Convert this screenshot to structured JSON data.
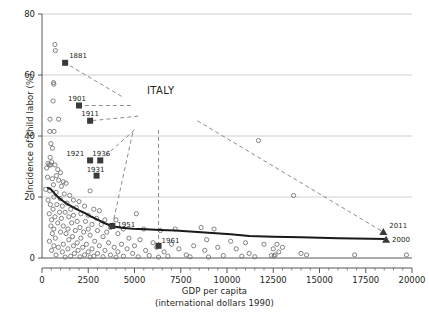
{
  "chart_data": {
    "type": "scatter",
    "title": "",
    "xlabel": "GDP per capita",
    "xlabel2": "(international dollars 1990)",
    "ylabel": "Incidence of child labor (%)",
    "xlim": [
      0,
      20000
    ],
    "ylim": [
      0,
      80
    ],
    "xticks": [
      0,
      2500,
      5000,
      7500,
      10000,
      12500,
      15000,
      17500,
      20000
    ],
    "yticks": [
      0,
      20,
      40,
      60,
      80
    ],
    "xtick_labels": [
      "0",
      "2500",
      "5000",
      "7500",
      "10000",
      "12500",
      "15000",
      "17500",
      "20000"
    ],
    "ytick_labels": [
      "0",
      "20",
      "40",
      "60",
      "80"
    ],
    "grid": "horizontal",
    "legend": "none",
    "annotation": "ITALY",
    "series": [
      {
        "name": "Other countries (scatter)",
        "marker": "open-circle",
        "color": "#6d6e71",
        "points": [
          [
            700,
            70
          ],
          [
            720,
            68
          ],
          [
            620,
            57.5
          ],
          [
            640,
            57.0
          ],
          [
            600,
            51.5
          ],
          [
            430,
            45.5
          ],
          [
            900,
            45.5
          ],
          [
            420,
            41.5
          ],
          [
            650,
            41.5
          ],
          [
            480,
            37.5
          ],
          [
            560,
            36.0
          ],
          [
            440,
            33.0
          ],
          [
            520,
            31.5
          ],
          [
            330,
            31.0
          ],
          [
            390,
            30.5
          ],
          [
            470,
            30.5
          ],
          [
            250,
            29.5
          ],
          [
            700,
            30.5
          ],
          [
            850,
            29.0
          ],
          [
            1000,
            28.0
          ],
          [
            780,
            27.0
          ],
          [
            300,
            26.5
          ],
          [
            560,
            26.0
          ],
          [
            900,
            25.5
          ],
          [
            1150,
            25.0
          ],
          [
            1300,
            24.5
          ],
          [
            620,
            24.0
          ],
          [
            1050,
            23.5
          ],
          [
            2600,
            22.0
          ],
          [
            200,
            22.5
          ],
          [
            420,
            22.0
          ],
          [
            760,
            21.5
          ],
          [
            1200,
            21.0
          ],
          [
            1500,
            20.5
          ],
          [
            640,
            20.0
          ],
          [
            980,
            19.5
          ],
          [
            330,
            19.0
          ],
          [
            1700,
            19.0
          ],
          [
            2000,
            18.5
          ],
          [
            1350,
            18.0
          ],
          [
            800,
            17.5
          ],
          [
            450,
            17.5
          ],
          [
            1100,
            17.0
          ],
          [
            2300,
            17.0
          ],
          [
            1850,
            16.5
          ],
          [
            600,
            16.0
          ],
          [
            1550,
            16.0
          ],
          [
            2800,
            16.0
          ],
          [
            3100,
            15.5
          ],
          [
            950,
            15.0
          ],
          [
            1250,
            15.0
          ],
          [
            2100,
            14.5
          ],
          [
            390,
            14.5
          ],
          [
            1700,
            14.0
          ],
          [
            2500,
            14.0
          ],
          [
            5100,
            14.5
          ],
          [
            700,
            13.5
          ],
          [
            1450,
            13.5
          ],
          [
            2950,
            13.0
          ],
          [
            1050,
            13.0
          ],
          [
            3400,
            12.5
          ],
          [
            520,
            12.5
          ],
          [
            1900,
            12.0
          ],
          [
            2350,
            12.0
          ],
          [
            4000,
            12.5
          ],
          [
            1600,
            11.5
          ],
          [
            850,
            11.5
          ],
          [
            2700,
            11.0
          ],
          [
            3200,
            11.0
          ],
          [
            1150,
            10.5
          ],
          [
            480,
            10.5
          ],
          [
            2050,
            10.0
          ],
          [
            3700,
            10.0
          ],
          [
            1400,
            9.5
          ],
          [
            2500,
            9.5
          ],
          [
            640,
            9.5
          ],
          [
            4400,
            9.5
          ],
          [
            1800,
            9.0
          ],
          [
            3000,
            9.0
          ],
          [
            5500,
            9.5
          ],
          [
            1000,
            8.5
          ],
          [
            2250,
            8.5
          ],
          [
            3500,
            8.5
          ],
          [
            6400,
            9.0
          ],
          [
            7200,
            9.5
          ],
          [
            560,
            8.0
          ],
          [
            1300,
            8.0
          ],
          [
            2600,
            7.5
          ],
          [
            4100,
            8.0
          ],
          [
            8600,
            10.0
          ],
          [
            9300,
            9.5
          ],
          [
            1650,
            7.0
          ],
          [
            3300,
            7.0
          ],
          [
            720,
            6.5
          ],
          [
            2100,
            6.5
          ],
          [
            4700,
            6.5
          ],
          [
            8900,
            6.0
          ],
          [
            1450,
            6.0
          ],
          [
            2850,
            5.5
          ],
          [
            5300,
            6.0
          ],
          [
            10200,
            5.5
          ],
          [
            400,
            5.5
          ],
          [
            1900,
            5.0
          ],
          [
            3600,
            5.0
          ],
          [
            6000,
            5.0
          ],
          [
            11000,
            5.0
          ],
          [
            1150,
            4.5
          ],
          [
            2400,
            4.5
          ],
          [
            4300,
            4.5
          ],
          [
            7000,
            4.5
          ],
          [
            12000,
            4.5
          ],
          [
            640,
            4.0
          ],
          [
            1700,
            4.0
          ],
          [
            3100,
            4.0
          ],
          [
            5000,
            4.0
          ],
          [
            8200,
            4.0
          ],
          [
            12700,
            4.5
          ],
          [
            880,
            3.5
          ],
          [
            2200,
            3.5
          ],
          [
            3900,
            3.5
          ],
          [
            6200,
            3.5
          ],
          [
            9500,
            3.5
          ],
          [
            13000,
            3.5
          ],
          [
            1400,
            3.0
          ],
          [
            2700,
            3.0
          ],
          [
            4600,
            3.0
          ],
          [
            7400,
            3.0
          ],
          [
            10500,
            3.0
          ],
          [
            12500,
            3.0
          ],
          [
            520,
            2.5
          ],
          [
            1950,
            2.5
          ],
          [
            3400,
            2.5
          ],
          [
            5600,
            2.5
          ],
          [
            8800,
            2.5
          ],
          [
            12800,
            2.0
          ],
          [
            1100,
            2.0
          ],
          [
            2500,
            2.0
          ],
          [
            4100,
            2.0
          ],
          [
            6600,
            2.0
          ],
          [
            11200,
            1.5
          ],
          [
            14000,
            1.5
          ],
          [
            1750,
            1.5
          ],
          [
            3000,
            1.5
          ],
          [
            4900,
            1.5
          ],
          [
            7800,
            1.0
          ],
          [
            12600,
            1.0
          ],
          [
            14300,
            1.0
          ],
          [
            760,
            1.0
          ],
          [
            2300,
            1.0
          ],
          [
            3700,
            1.0
          ],
          [
            5800,
            0.8
          ],
          [
            9800,
            0.8
          ],
          [
            12400,
            0.8
          ],
          [
            16900,
            1.0
          ],
          [
            1550,
            0.6
          ],
          [
            2800,
            0.6
          ],
          [
            4400,
            0.6
          ],
          [
            6800,
            0.6
          ],
          [
            10800,
            0.6
          ],
          [
            12550,
            0.6
          ],
          [
            19700,
            1.0
          ],
          [
            2050,
            0.4
          ],
          [
            3300,
            0.4
          ],
          [
            5200,
            0.4
          ],
          [
            8000,
            0.4
          ],
          [
            11500,
            0.4
          ],
          [
            1250,
            0.3
          ],
          [
            2600,
            0.3
          ],
          [
            4000,
            0.3
          ],
          [
            6300,
            0.3
          ],
          [
            9000,
            0.3
          ],
          [
            13600,
            20.5
          ],
          [
            11700,
            38.5
          ]
        ]
      },
      {
        "name": "Italy (historical, squares)",
        "marker": "filled-square",
        "color": "#3a3a3a",
        "points": [
          {
            "year": "1881",
            "x": 1250,
            "y": 64
          },
          {
            "year": "1901",
            "x": 2000,
            "y": 50
          },
          {
            "year": "1911",
            "x": 2600,
            "y": 45
          },
          {
            "year": "1921",
            "x": 2600,
            "y": 32
          },
          {
            "year": "1936",
            "x": 3150,
            "y": 32
          },
          {
            "year": "1931",
            "x": 2950,
            "y": 27
          },
          {
            "year": "1951",
            "x": 3800,
            "y": 10.5
          },
          {
            "year": "1961",
            "x": 6300,
            "y": 4
          }
        ]
      },
      {
        "name": "Italy (recent, triangles)",
        "marker": "filled-triangle",
        "color": "#3a3a3a",
        "points": [
          {
            "year": "2011",
            "x": 18450,
            "y": 8.5
          },
          {
            "year": "2000",
            "x": 18600,
            "y": 6.0
          }
        ]
      }
    ],
    "trend_line": {
      "name": "Fitted trend",
      "color": "#1a1a1a",
      "points": [
        [
          320,
          23.0
        ],
        [
          430,
          22.8
        ],
        [
          560,
          22.0
        ],
        [
          700,
          21.0
        ],
        [
          900,
          19.8
        ],
        [
          1150,
          18.6
        ],
        [
          1400,
          17.6
        ],
        [
          1700,
          16.6
        ],
        [
          2000,
          15.6
        ],
        [
          2300,
          14.8
        ],
        [
          2650,
          13.6
        ],
        [
          3000,
          12.6
        ],
        [
          3400,
          11.4
        ],
        [
          3800,
          10.4
        ],
        [
          4300,
          9.9
        ],
        [
          4900,
          9.6
        ],
        [
          5600,
          9.4
        ],
        [
          6400,
          9.2
        ],
        [
          7200,
          9.0
        ],
        [
          8200,
          8.6
        ],
        [
          9200,
          8.2
        ],
        [
          10200,
          7.8
        ],
        [
          11200,
          7.2
        ],
        [
          12500,
          7.0
        ],
        [
          14000,
          6.8
        ],
        [
          16000,
          6.5
        ],
        [
          18600,
          6.2
        ]
      ]
    },
    "leader_lines": [
      {
        "from": [
          1250,
          64
        ],
        "to": [
          4300,
          53
        ]
      },
      {
        "from": [
          2000,
          50
        ],
        "to": [
          4800,
          50
        ]
      },
      {
        "from": [
          2600,
          45
        ],
        "to": [
          5200,
          46.5
        ]
      },
      {
        "from": [
          3150,
          32
        ],
        "to": [
          5000,
          42
        ]
      },
      {
        "from": [
          3800,
          10.5
        ],
        "to": [
          4900,
          41
        ]
      },
      {
        "from": [
          6300,
          4
        ],
        "to": [
          6300,
          42
        ]
      },
      {
        "from": [
          18450,
          8.5
        ],
        "to": [
          8400,
          45
        ]
      }
    ]
  },
  "marks": {
    "italy_annotation": "ITALY"
  }
}
